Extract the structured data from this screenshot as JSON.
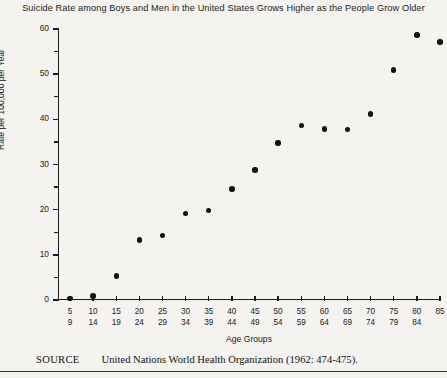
{
  "chart_data": {
    "type": "scatter",
    "title": "Suicide Rate among Boys and Men in the United States Grows Higher as the People Grow Older",
    "xlabel": "Age Groups",
    "ylabel": "Rate per 100,000 per Year",
    "ylim": [
      0,
      60
    ],
    "y_major_ticks": [
      0,
      10,
      20,
      30,
      40,
      50,
      60
    ],
    "y_minor_ticks": [
      5,
      15,
      25,
      35,
      45,
      55
    ],
    "y_tick_labels": [
      "0",
      "10",
      "20",
      "30",
      "40",
      "50",
      "60"
    ],
    "grid": false,
    "legend": null,
    "categories": [
      "5-9",
      "10-14",
      "15-19",
      "20-24",
      "25-29",
      "30-34",
      "35-39",
      "40-44",
      "45-49",
      "50-54",
      "55-59",
      "60-64",
      "65-69",
      "70-74",
      "75-79",
      "80-84",
      "85"
    ],
    "category_lines": [
      {
        "top": "5",
        "bottom": "9"
      },
      {
        "top": "10",
        "bottom": "14"
      },
      {
        "top": "15",
        "bottom": "19"
      },
      {
        "top": "20",
        "bottom": "24"
      },
      {
        "top": "25",
        "bottom": "29"
      },
      {
        "top": "30",
        "bottom": "34"
      },
      {
        "top": "35",
        "bottom": "39"
      },
      {
        "top": "40",
        "bottom": "44"
      },
      {
        "top": "45",
        "bottom": "49"
      },
      {
        "top": "50",
        "bottom": "54"
      },
      {
        "top": "55",
        "bottom": "59"
      },
      {
        "top": "60",
        "bottom": "64"
      },
      {
        "top": "65",
        "bottom": "69"
      },
      {
        "top": "70",
        "bottom": "74"
      },
      {
        "top": "75",
        "bottom": "79"
      },
      {
        "top": "80",
        "bottom": "84"
      },
      {
        "top": "85",
        "bottom": ""
      }
    ],
    "values": [
      0.3,
      0.9,
      5.3,
      13.3,
      14.3,
      19.1,
      19.8,
      24.6,
      28.8,
      34.8,
      38.6,
      37.9,
      37.7,
      41.2,
      50.9,
      58.7,
      57.1
    ],
    "marker": "filled-circle",
    "marker_color": "#111111"
  },
  "source": {
    "label": "SOURCE",
    "text": "United Nations World Health Organization (1962: 474-475)."
  }
}
